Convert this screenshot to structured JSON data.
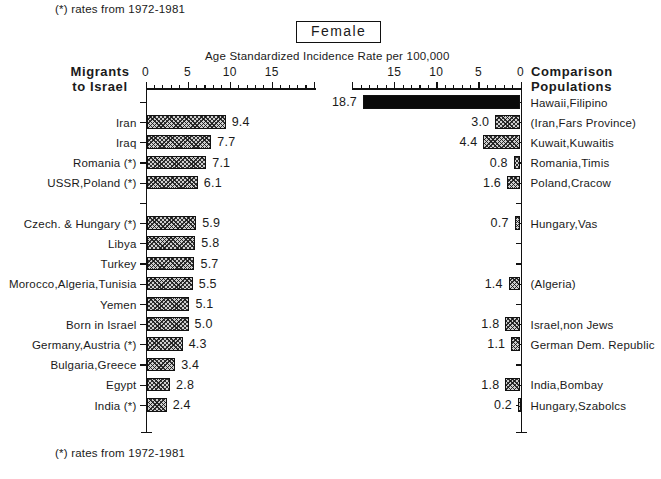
{
  "figure": {
    "title": "Female",
    "axis_title": "Age Standardized Incidence Rate per 100,000",
    "note_top": "(*) rates from 1972-1981",
    "note_bottom": "(*) rates from 1972-1981",
    "left_column_header_line1": "Migrants",
    "left_column_header_line2": "to Israel",
    "right_column_header_line1": "Comparison",
    "right_column_header_line2": "Populations"
  },
  "axes": {
    "left_ticks": [
      "0",
      "5",
      "10",
      "15"
    ],
    "right_ticks": [
      "15",
      "10",
      "5",
      "0"
    ],
    "left_range": [
      0,
      20
    ],
    "right_range": [
      0,
      20
    ],
    "minor_tick_step": 1
  },
  "chart_data": {
    "type": "bar",
    "title": "Female",
    "subtitle": "Age Standardized Incidence Rate per 100,000",
    "xlabel": "Age Standardized Incidence Rate per 100,000",
    "ylabel": "",
    "orientation": "horizontal",
    "grid": false,
    "legend": "none",
    "panels": [
      {
        "name": "Migrants to Israel",
        "direction": "left-to-right",
        "xlim": [
          0,
          20
        ],
        "xticks": [
          0,
          5,
          10,
          15
        ],
        "categories": [
          "Iran",
          "Iraq",
          "Romania (*)",
          "USSR,Poland (*)",
          "Czech. & Hungary (*)",
          "Libya",
          "Turkey",
          "Morocco,Algeria,Tunisia",
          "Yemen",
          "Born in Israel",
          "Germany,Austria (*)",
          "Bulgaria,Greece",
          "Egypt",
          "India (*)"
        ],
        "values": [
          9.4,
          7.7,
          7.1,
          6.1,
          5.9,
          5.8,
          5.7,
          5.5,
          5.1,
          5.0,
          4.3,
          3.4,
          2.8,
          2.4
        ]
      },
      {
        "name": "Comparison Populations",
        "direction": "right-to-left",
        "xlim": [
          0,
          20
        ],
        "xticks": [
          0,
          5,
          10,
          15
        ],
        "categories": [
          "Hawaii,Filipino",
          "(Iran,Fars Province)",
          "Kuwait,Kuwaitis",
          "Romania,Timis",
          "Poland,Cracow",
          "Hungary,Vas",
          "(Algeria)",
          "Israel,non Jews",
          "German Dem. Republic",
          "India,Bombay",
          "Hungary,Szabolcs"
        ],
        "values": [
          18.7,
          3.0,
          4.4,
          0.8,
          1.6,
          0.7,
          1.4,
          1.8,
          1.1,
          1.8,
          0.2
        ]
      }
    ]
  },
  "rows": [
    {
      "row": 0,
      "left_label": "",
      "left_value": "",
      "right_label": "Hawaii,Filipino",
      "right_value": "18.7",
      "fill": "solid"
    },
    {
      "row": 1,
      "left_label": "Iran",
      "left_value": "9.4",
      "right_label": "(Iran,Fars Province)",
      "right_value": "3.0"
    },
    {
      "row": 2,
      "left_label": "Iraq",
      "left_value": "7.7",
      "right_label": "Kuwait,Kuwaitis",
      "right_value": "4.4"
    },
    {
      "row": 3,
      "left_label": "Romania (*)",
      "left_value": "7.1",
      "right_label": "Romania,Timis",
      "right_value": "0.8"
    },
    {
      "row": 4,
      "left_label": "USSR,Poland (*)",
      "left_value": "6.1",
      "right_label": "Poland,Cracow",
      "right_value": "1.6"
    },
    {
      "row": 5,
      "left_label": "",
      "left_value": "",
      "right_label": "",
      "right_value": ""
    },
    {
      "row": 6,
      "left_label": "Czech. & Hungary (*)",
      "left_value": "5.9",
      "right_label": "Hungary,Vas",
      "right_value": "0.7"
    },
    {
      "row": 7,
      "left_label": "Libya",
      "left_value": "5.8",
      "right_label": "",
      "right_value": ""
    },
    {
      "row": 8,
      "left_label": "Turkey",
      "left_value": "5.7",
      "right_label": "",
      "right_value": ""
    },
    {
      "row": 9,
      "left_label": "Morocco,Algeria,Tunisia",
      "left_value": "5.5",
      "right_label": "(Algeria)",
      "right_value": "1.4"
    },
    {
      "row": 10,
      "left_label": "Yemen",
      "left_value": "5.1",
      "right_label": "",
      "right_value": ""
    },
    {
      "row": 11,
      "left_label": "Born in Israel",
      "left_value": "5.0",
      "right_label": "Israel,non Jews",
      "right_value": "1.8"
    },
    {
      "row": 12,
      "left_label": "Germany,Austria (*)",
      "left_value": "4.3",
      "right_label": "German Dem. Republic",
      "right_value": "1.1"
    },
    {
      "row": 13,
      "left_label": "Bulgaria,Greece",
      "left_value": "3.4",
      "right_label": "",
      "right_value": ""
    },
    {
      "row": 14,
      "left_label": "Egypt",
      "left_value": "2.8",
      "right_label": "India,Bombay",
      "right_value": "1.8"
    },
    {
      "row": 15,
      "left_label": "India (*)",
      "left_value": "2.4",
      "right_label": "Hungary,Szabolcs",
      "right_value": "0.2"
    }
  ]
}
